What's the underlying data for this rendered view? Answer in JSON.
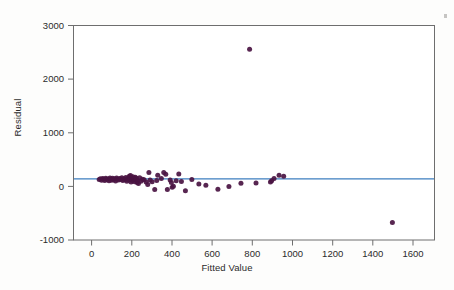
{
  "figure": {
    "background_color": "#fdfdfc",
    "marker_color": "#4a1442",
    "reference_line_color": "#3d7ebf",
    "axis_color": "#6e6e6e",
    "text_color": "#2b2b2b"
  },
  "chart_data": {
    "type": "scatter",
    "title": "",
    "xlabel": "Fitted Value",
    "ylabel": "Residual",
    "xlim": [
      -120,
      1680
    ],
    "ylim": [
      -1230,
      3090
    ],
    "xticks": [
      0,
      200,
      400,
      600,
      800,
      1000,
      1200,
      1400,
      1600
    ],
    "xticklabels": [
      "0",
      "200",
      "400",
      "600",
      "800",
      "1000",
      "1200",
      "1400",
      "1600"
    ],
    "yticks": [
      -1000,
      0,
      1000,
      2000,
      3000
    ],
    "yticklabels": [
      "-1000",
      "0",
      "1000",
      "2000",
      "3000"
    ],
    "grid": false,
    "legend": null,
    "reference_line": {
      "orientation": "horizontal",
      "y": 0
    },
    "series": [
      {
        "name": "residuals",
        "marker": "circle",
        "marker_size": 5,
        "color": "#4a1442",
        "points": [
          [
            8,
            -10
          ],
          [
            14,
            5
          ],
          [
            20,
            -25
          ],
          [
            26,
            10
          ],
          [
            30,
            -5
          ],
          [
            36,
            -30
          ],
          [
            41,
            15
          ],
          [
            46,
            -12
          ],
          [
            52,
            0
          ],
          [
            57,
            -35
          ],
          [
            62,
            20
          ],
          [
            66,
            -8
          ],
          [
            71,
            -28
          ],
          [
            75,
            12
          ],
          [
            80,
            -18
          ],
          [
            85,
            4
          ],
          [
            90,
            -40
          ],
          [
            95,
            18
          ],
          [
            100,
            -6
          ],
          [
            105,
            -22
          ],
          [
            110,
            8
          ],
          [
            116,
            -14
          ],
          [
            121,
            25
          ],
          [
            126,
            -32
          ],
          [
            131,
            2
          ],
          [
            136,
            -16
          ],
          [
            141,
            30
          ],
          [
            146,
            -45
          ],
          [
            150,
            10
          ],
          [
            155,
            -24
          ],
          [
            158,
            55
          ],
          [
            161,
            -8
          ],
          [
            164,
            70
          ],
          [
            167,
            -60
          ],
          [
            170,
            20
          ],
          [
            173,
            -30
          ],
          [
            176,
            45
          ],
          [
            179,
            -12
          ],
          [
            182,
            5
          ],
          [
            185,
            -55
          ],
          [
            188,
            35
          ],
          [
            191,
            -20
          ],
          [
            194,
            15
          ],
          [
            197,
            -70
          ],
          [
            200,
            -40
          ],
          [
            204,
            -90
          ],
          [
            210,
            25
          ],
          [
            216,
            -48
          ],
          [
            224,
            -8
          ],
          [
            232,
            -15
          ],
          [
            242,
            -60
          ],
          [
            250,
            -110
          ],
          [
            256,
            130
          ],
          [
            262,
            -20
          ],
          [
            272,
            -55
          ],
          [
            285,
            -215
          ],
          [
            295,
            -30
          ],
          [
            300,
            75
          ],
          [
            318,
            10
          ],
          [
            330,
            130
          ],
          [
            340,
            95
          ],
          [
            348,
            -215
          ],
          [
            362,
            -20
          ],
          [
            368,
            -70
          ],
          [
            372,
            -170
          ],
          [
            378,
            -145
          ],
          [
            392,
            -35
          ],
          [
            405,
            100
          ],
          [
            418,
            -50
          ],
          [
            438,
            -240
          ],
          [
            470,
            -10
          ],
          [
            505,
            -100
          ],
          [
            540,
            -125
          ],
          [
            600,
            -210
          ],
          [
            655,
            -155
          ],
          [
            715,
            -85
          ],
          [
            758,
            2610
          ],
          [
            790,
            -80
          ],
          [
            862,
            -60
          ],
          [
            868,
            -35
          ],
          [
            880,
            10
          ],
          [
            905,
            75
          ],
          [
            928,
            55
          ],
          [
            1470,
            -880
          ]
        ]
      }
    ]
  }
}
